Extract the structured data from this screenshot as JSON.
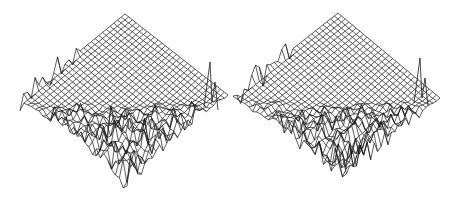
{
  "figure": {
    "panels": [
      {
        "id": "left",
        "x": 0,
        "top": [
          125,
          14
        ],
        "left": [
          20,
          100
        ],
        "right": [
          228,
          95
        ],
        "bottom": [
          127,
          193
        ],
        "grid_divisions": 28,
        "seed": 7,
        "spike": [
          210,
          62
        ]
      },
      {
        "id": "right",
        "x": 233,
        "top": [
          105,
          13
        ],
        "left": [
          0,
          96
        ],
        "right": [
          207,
          98
        ],
        "bottom": [
          110,
          192
        ],
        "grid_divisions": 28,
        "seed": 19,
        "spike": [
          187,
          58
        ]
      }
    ],
    "colors": {
      "line": "#1a1a1a",
      "background": "#ffffff"
    }
  }
}
